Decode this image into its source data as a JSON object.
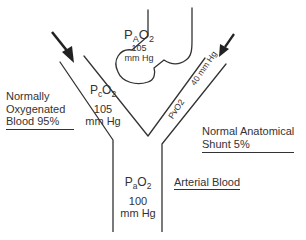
{
  "alveolus": {
    "label_prefix": "P",
    "label_sub": "A",
    "label_suffix": "O",
    "label_suffix_sub": "2",
    "value": "105",
    "unit": "mm Hg"
  },
  "capillary_branch": {
    "label_prefix": "P",
    "label_sub": "c",
    "label_suffix": "O",
    "label_suffix_sub": "2",
    "value": "105",
    "unit": "mm Hg",
    "description_lines": [
      "Normally",
      "Oxygenated",
      "Blood 95%"
    ]
  },
  "shunt_branch": {
    "label": "PvO2",
    "value_text": "40 mm Hg",
    "description_lines": [
      "Normal Anatomical",
      "Shunt 5%"
    ]
  },
  "arterial": {
    "label_prefix": "P",
    "label_sub": "a",
    "label_suffix": "O",
    "label_suffix_sub": "2",
    "value": "100",
    "unit": "mm Hg",
    "description": "Arterial Blood"
  },
  "colors": {
    "line": "#333333",
    "arrow": "#222222",
    "background": "#ffffff"
  }
}
